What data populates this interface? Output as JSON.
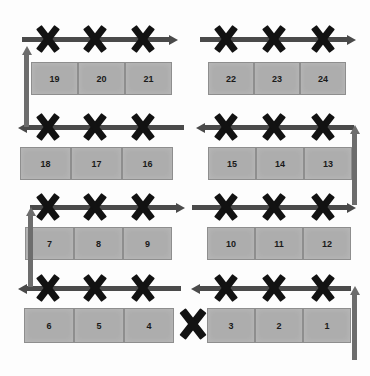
{
  "diagram": {
    "type": "grid-path-diagram",
    "colors": {
      "cell_fill": "#adadad",
      "cell_border": "#8e8e8e",
      "horizontal_arrow": "#4a4a4a",
      "vertical_arrow": "#6d6d6d",
      "x_marker": "#121212",
      "background": "#ffffff",
      "label_text": "#1a1a1a"
    },
    "rows": [
      {
        "index": 1,
        "arrow_direction_left_group": "right",
        "arrow_direction_right_group": "right",
        "left_group": [
          {
            "label": "19"
          },
          {
            "label": "20"
          },
          {
            "label": "21"
          }
        ],
        "right_group": [
          {
            "label": "22"
          },
          {
            "label": "23"
          },
          {
            "label": "24"
          }
        ]
      },
      {
        "index": 2,
        "arrow_direction_left_group": "left",
        "arrow_direction_right_group": "left",
        "left_group": [
          {
            "label": "18"
          },
          {
            "label": "17"
          },
          {
            "label": "16"
          }
        ],
        "right_group": [
          {
            "label": "15"
          },
          {
            "label": "14"
          },
          {
            "label": "13"
          }
        ]
      },
      {
        "index": 3,
        "arrow_direction_left_group": "right",
        "arrow_direction_right_group": "right",
        "left_group": [
          {
            "label": "7"
          },
          {
            "label": "8"
          },
          {
            "label": "9"
          }
        ],
        "right_group": [
          {
            "label": "10"
          },
          {
            "label": "11"
          },
          {
            "label": "12"
          }
        ]
      },
      {
        "index": 4,
        "arrow_direction_left_group": "left",
        "arrow_direction_right_group": "left",
        "left_group": [
          {
            "label": "6"
          },
          {
            "label": "5"
          },
          {
            "label": "4"
          }
        ],
        "right_group": [
          {
            "label": "3"
          },
          {
            "label": "2"
          },
          {
            "label": "1"
          }
        ]
      }
    ],
    "vertical_connectors": [
      {
        "id": "left-row1-row2",
        "side": "left",
        "direction": "up"
      },
      {
        "id": "right-row2-row3",
        "side": "right",
        "direction": "up"
      },
      {
        "id": "left-row3-row4",
        "side": "left",
        "direction": "up"
      },
      {
        "id": "right-row4-exit",
        "side": "right",
        "direction": "up"
      }
    ],
    "x_marker_count_per_group": 3,
    "standalone_x_marker": {
      "id": "center-bottom-x",
      "present": true
    }
  }
}
